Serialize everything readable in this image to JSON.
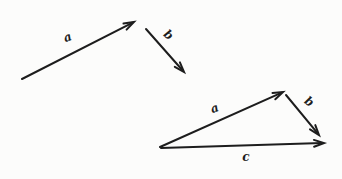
{
  "figure": {
    "background": "#fcfcfb",
    "ink": "#1d1d1d"
  },
  "vectors": [
    {
      "id": "free-a",
      "label": "a",
      "x1": 22,
      "y1": 79,
      "x2": 134,
      "y2": 22,
      "lx": 69,
      "ly": 41,
      "langle": -20
    },
    {
      "id": "free-b",
      "label": "b",
      "x1": 146,
      "y1": 29,
      "x2": 184,
      "y2": 72,
      "lx": 166,
      "ly": 38,
      "langle": 40
    },
    {
      "id": "tri-a",
      "label": "a",
      "x1": 160,
      "y1": 147,
      "x2": 283,
      "y2": 92,
      "lx": 216,
      "ly": 112,
      "langle": -20
    },
    {
      "id": "tri-b",
      "label": "b",
      "x1": 286,
      "y1": 95,
      "x2": 319,
      "y2": 135,
      "lx": 307,
      "ly": 105,
      "langle": 35
    },
    {
      "id": "tri-c",
      "label": "c",
      "x1": 161,
      "y1": 148,
      "x2": 324,
      "y2": 143,
      "lx": 246,
      "ly": 161,
      "langle": 0
    }
  ],
  "arrow_style": {
    "head_length": 10,
    "head_width": 3.4,
    "stroke_width": 2
  }
}
